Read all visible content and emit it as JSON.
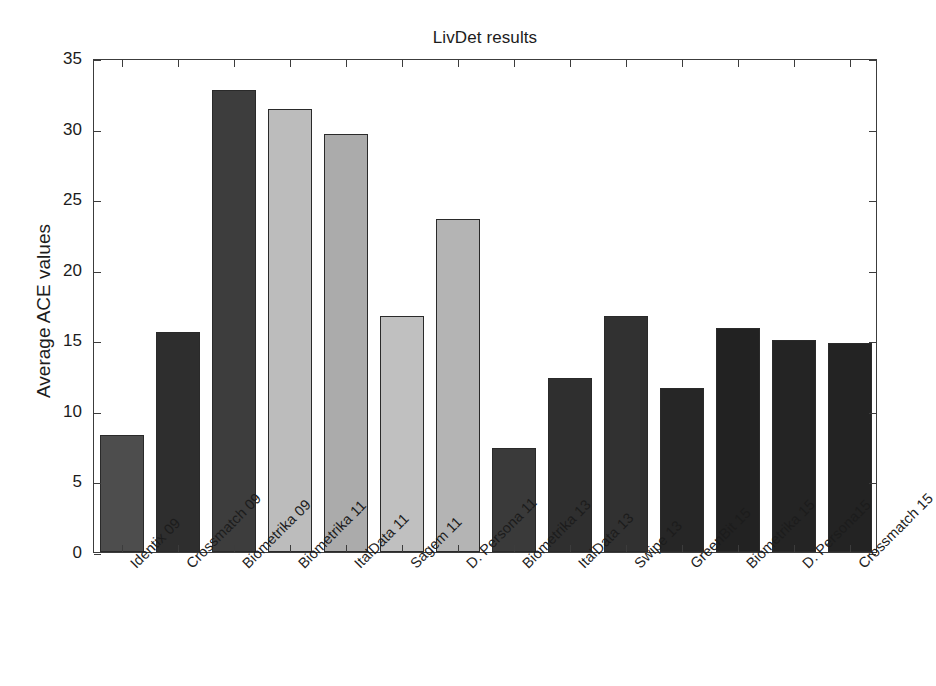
{
  "chart_data": {
    "type": "bar",
    "title": "LivDet results",
    "xlabel": "",
    "ylabel": "Average ACE values",
    "ylim": [
      0,
      35
    ],
    "ytick_labels": [
      "0",
      "5",
      "10",
      "15",
      "20",
      "25",
      "30",
      "35"
    ],
    "ytick_values": [
      0,
      5,
      10,
      15,
      20,
      25,
      30,
      35
    ],
    "grid": false,
    "legend": null,
    "categories": [
      "Identix 09",
      "Crossmatch 09",
      "Biometrika 09",
      "Biometrika 11",
      "ItalData 11",
      "Sagem 11",
      "D. Persona 11",
      "Biometrika 13",
      "ItalData 13",
      "Swipe 13",
      "GreenBit 15",
      "Biometrika 15",
      "D. Persona15",
      "Crossmatch 15"
    ],
    "values": [
      8.3,
      15.6,
      32.7,
      31.4,
      29.6,
      16.7,
      23.6,
      7.4,
      12.3,
      16.7,
      11.6,
      15.9,
      15.0,
      14.8
    ],
    "bar_colors": [
      "#4d4d4d",
      "#2e2e2e",
      "#3d3d3d",
      "#bcbcbc",
      "#ababab",
      "#c0c0c0",
      "#b4b4b4",
      "#3a3a3a",
      "#2f2f2f",
      "#313131",
      "#262626",
      "#222222",
      "#242424",
      "#232323"
    ],
    "bar_edge_color": "#2a2a2a",
    "axis_color": "#3c3c3c",
    "background_color": "#ffffff"
  }
}
